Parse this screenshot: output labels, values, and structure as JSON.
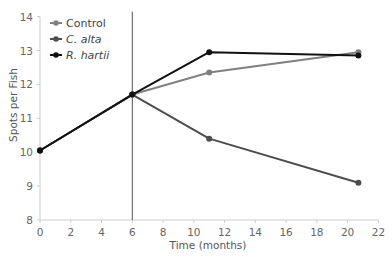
{
  "chart_data": {
    "type": "line",
    "title": "",
    "xlabel": "Time (months)",
    "ylabel": "Spots per Fish",
    "xlim": [
      0,
      22
    ],
    "ylim": [
      8,
      14
    ],
    "xticks": [
      0,
      2,
      4,
      6,
      8,
      10,
      12,
      14,
      16,
      18,
      20,
      22
    ],
    "yticks": [
      8,
      9,
      10,
      11,
      12,
      13,
      14
    ],
    "grid": false,
    "legend": "top-left",
    "annotations": [
      {
        "type": "vertical-line",
        "x": 6
      }
    ],
    "series": [
      {
        "name": "Control",
        "italic": false,
        "color": "#808080",
        "x": [
          0,
          6,
          11,
          20.7
        ],
        "y": [
          10.05,
          11.7,
          12.35,
          12.95
        ]
      },
      {
        "name": "C. alta",
        "italic": true,
        "color": "#4d4d4d",
        "x": [
          0,
          6,
          11,
          20.7
        ],
        "y": [
          10.05,
          11.7,
          10.4,
          9.1
        ]
      },
      {
        "name": "R. hartii",
        "italic": true,
        "color": "#111111",
        "x": [
          0,
          6,
          11,
          20.7
        ],
        "y": [
          10.05,
          11.7,
          12.95,
          12.85
        ]
      }
    ]
  }
}
